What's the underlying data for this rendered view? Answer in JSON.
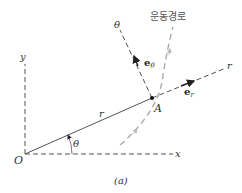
{
  "figure": {
    "caption": "(a)",
    "labels": {
      "origin": "O",
      "x_axis": "x",
      "y_axis": "y",
      "r_axis": "r",
      "theta_axis": "θ",
      "radius": "r",
      "angle": "θ",
      "point": "A",
      "path": "운동경로",
      "unit_r": "e",
      "unit_r_sub": "r",
      "unit_theta": "e",
      "unit_theta_sub": "θ"
    },
    "colors": {
      "line": "#555555",
      "path": "#aaaaaa",
      "text": "#333333"
    }
  }
}
